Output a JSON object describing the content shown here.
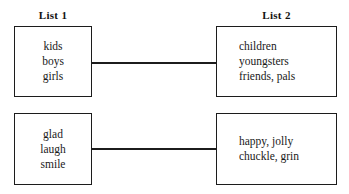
{
  "diagram": {
    "type": "paired-lists",
    "headers": {
      "left": "List 1",
      "right": "List 2"
    },
    "pairs": [
      {
        "left_box": {
          "items": [
            "kids",
            "boys",
            "girls"
          ],
          "text": "kids\nboys\ngirls"
        },
        "right_box": {
          "items": [
            "children",
            "youngsters",
            "friends, pals"
          ],
          "text": "children\nyoungsters\nfriends, pals"
        },
        "connector": "horizontal-line"
      },
      {
        "left_box": {
          "items": [
            "glad",
            "laugh",
            "smile"
          ],
          "text": "glad\nlaugh\nsmile"
        },
        "right_box": {
          "items": [
            "happy, jolly",
            "chuckle, grin"
          ],
          "text": "happy, jolly\nchuckle, grin"
        },
        "connector": "horizontal-line"
      }
    ],
    "colors": {
      "background": "#ffffff",
      "border": "#1c1c1c",
      "text": "#1a1a1a",
      "connector": "#1c1c1c"
    }
  }
}
